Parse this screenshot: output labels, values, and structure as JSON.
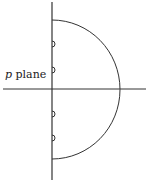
{
  "diagram": {
    "label": {
      "variable": "p",
      "text": "plane"
    },
    "elements": [
      "real axis (horizontal)",
      "imaginary axis (vertical)",
      "semicircular contour in right half-plane",
      "four small indentations around poles on imaginary axis"
    ],
    "colors": {
      "line": "#333333",
      "background": "#ffffff"
    }
  }
}
